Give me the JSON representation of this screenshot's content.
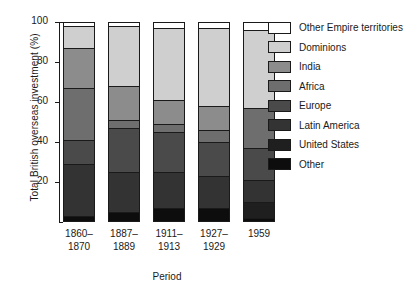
{
  "chart_data": {
    "type": "bar",
    "subtype": "stacked-bar-100-percent",
    "title": "",
    "xlabel": "Period",
    "ylabel": "Total British overseas investment (%)",
    "ylim": [
      0,
      100
    ],
    "yticks": [
      0,
      20,
      40,
      60,
      80,
      100
    ],
    "ytick_labels": [
      "",
      "20",
      "40",
      "60",
      "80",
      "100"
    ],
    "grid": false,
    "legend_position": "right",
    "categories": [
      "1860–\n1870",
      "1887–\n1889",
      "1911–\n1913",
      "1927–\n1929",
      "1959"
    ],
    "category_labels": [
      {
        "line1": "1860–",
        "line2": "1870"
      },
      {
        "line1": "1887–",
        "line2": "1889"
      },
      {
        "line1": "1911–",
        "line2": "1913"
      },
      {
        "line1": "1927–",
        "line2": "1929"
      },
      {
        "line1": "1959",
        "line2": ""
      }
    ],
    "series": [
      {
        "name": "Other",
        "color": "#0d0d0d",
        "values": [
          3,
          5,
          7,
          7,
          2
        ]
      },
      {
        "name": "United States",
        "color": "#1f1f1f",
        "values": [
          0,
          0,
          0,
          0,
          8
        ]
      },
      {
        "name": "Latin America",
        "color": "#333333",
        "values": [
          26,
          20,
          18,
          16,
          11
        ]
      },
      {
        "name": "Europe",
        "color": "#4a4a4a",
        "values": [
          12,
          22,
          20,
          17,
          16
        ]
      },
      {
        "name": "Africa",
        "color": "#6e6e6e",
        "values": [
          26,
          4,
          4,
          6,
          20
        ]
      },
      {
        "name": "India",
        "color": "#8c8c8c",
        "values": [
          20,
          17,
          12,
          12,
          0
        ]
      },
      {
        "name": "Dominions",
        "color": "#cfcfcf",
        "values": [
          11,
          30,
          36,
          39,
          39
        ]
      },
      {
        "name": "Other Empire territories",
        "color": "#ffffff",
        "values": [
          2,
          2,
          3,
          3,
          4
        ]
      }
    ]
  },
  "legend": {
    "entries": [
      {
        "label": "Other Empire territories",
        "color": "#ffffff"
      },
      {
        "label": "Dominions",
        "color": "#cfcfcf"
      },
      {
        "label": "India",
        "color": "#8c8c8c"
      },
      {
        "label": "Africa",
        "color": "#6e6e6e"
      },
      {
        "label": "Europe",
        "color": "#4a4a4a"
      },
      {
        "label": "Latin America",
        "color": "#333333"
      },
      {
        "label": "United States",
        "color": "#1f1f1f"
      },
      {
        "label": "Other",
        "color": "#0d0d0d"
      }
    ]
  }
}
